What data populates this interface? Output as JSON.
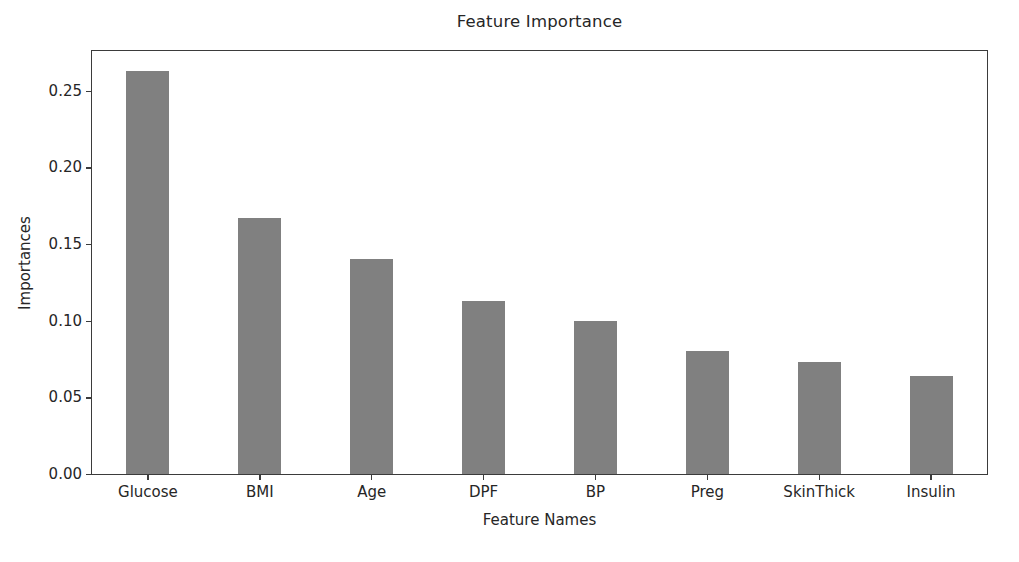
{
  "chart_data": {
    "type": "bar",
    "title": "Feature Importance",
    "xlabel": "Feature Names",
    "ylabel": "Importances",
    "categories": [
      "Glucose",
      "BMI",
      "Age",
      "DPF",
      "BP",
      "Preg",
      "SkinThick",
      "Insulin"
    ],
    "values": [
      0.263,
      0.167,
      0.14,
      0.113,
      0.1,
      0.08,
      0.073,
      0.064
    ],
    "ylim": [
      0.0,
      0.276
    ],
    "yticks": [
      0.0,
      0.05,
      0.1,
      0.15,
      0.2,
      0.25
    ],
    "ytick_labels": [
      "0.00",
      "0.05",
      "0.10",
      "0.15",
      "0.20",
      "0.25"
    ],
    "grid": false,
    "legend": null,
    "bar_color": "#808080",
    "frame_color": "#3b3b3b",
    "background": "#ffffff"
  }
}
